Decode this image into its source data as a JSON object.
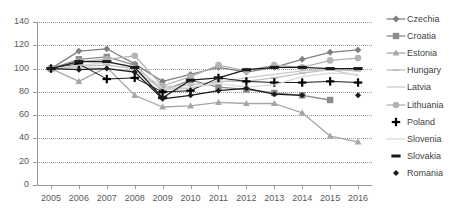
{
  "chart_data": {
    "type": "line",
    "title": "",
    "xlabel": "",
    "ylabel": "",
    "x": [
      2005,
      2006,
      2007,
      2008,
      2009,
      2010,
      2011,
      2012,
      2013,
      2014,
      2015,
      2016
    ],
    "xlim": [
      2005,
      2016
    ],
    "ylim": [
      0,
      140
    ],
    "ytick_step": 20,
    "yticks": [
      0,
      20,
      40,
      60,
      80,
      100,
      120,
      140
    ],
    "xticks": [
      "2005",
      "2006",
      "2007",
      "2008",
      "2009",
      "2010",
      "2011",
      "2012",
      "2013",
      "2014",
      "2015",
      "2016"
    ],
    "grid": true,
    "legend_position": "right",
    "series": [
      {
        "name": "Czechia",
        "marker": "diamond",
        "color": "#808080",
        "values": [
          100,
          115,
          117,
          104,
          89,
          95,
          101,
          97,
          101,
          108,
          114,
          116
        ]
      },
      {
        "name": "Croatia",
        "marker": "square",
        "color": "#8c8c8c",
        "values": [
          100,
          108,
          110,
          103,
          81,
          90,
          84,
          82,
          79,
          77,
          73,
          null
        ]
      },
      {
        "name": "Estonia",
        "marker": "triangle",
        "color": "#a6a6a6",
        "values": [
          100,
          89,
          101,
          77,
          67,
          68,
          71,
          70,
          70,
          62,
          42,
          37
        ]
      },
      {
        "name": "Hungary",
        "marker": "dash-small",
        "color": "#bfbfbf",
        "values": [
          100,
          102,
          103,
          100,
          84,
          86,
          89,
          89,
          92,
          96,
          99,
          98
        ]
      },
      {
        "name": "Latvia",
        "marker": "line",
        "color": "#c9c9c9",
        "values": [
          100,
          101,
          100,
          98,
          82,
          83,
          88,
          92,
          95,
          98,
          99,
          94
        ]
      },
      {
        "name": "Lithuania",
        "marker": "circle",
        "color": "#b3b3b3",
        "values": [
          100,
          106,
          108,
          111,
          85,
          93,
          103,
          98,
          103,
          101,
          107,
          109
        ]
      },
      {
        "name": "Poland",
        "marker": "plus",
        "color": "#000000",
        "values": [
          100,
          104,
          91,
          92,
          80,
          81,
          92,
          89,
          88,
          88,
          89,
          88
        ]
      },
      {
        "name": "Slovenia",
        "marker": "line",
        "color": "#d9d9d9",
        "values": [
          100,
          103,
          105,
          102,
          83,
          84,
          87,
          84,
          86,
          93,
          96,
          95
        ]
      },
      {
        "name": "Slovakia",
        "marker": "dash",
        "color": "#1a1a1a",
        "values": [
          100,
          106,
          106,
          101,
          75,
          90,
          92,
          99,
          101,
          101,
          100,
          100
        ]
      },
      {
        "name": "Romania",
        "marker": "diamond-small",
        "color": "#1a1a1a",
        "values": [
          100,
          99,
          100,
          97,
          74,
          77,
          81,
          83,
          78,
          77,
          null,
          77
        ]
      }
    ]
  },
  "legend": {
    "items": [
      {
        "label": "Czechia"
      },
      {
        "label": "Croatia"
      },
      {
        "label": "Estonia"
      },
      {
        "label": "Hungary"
      },
      {
        "label": "Latvia"
      },
      {
        "label": "Lithuania"
      },
      {
        "label": "Poland"
      },
      {
        "label": "Slovenia"
      },
      {
        "label": "Slovakia"
      },
      {
        "label": "Romania"
      }
    ]
  }
}
